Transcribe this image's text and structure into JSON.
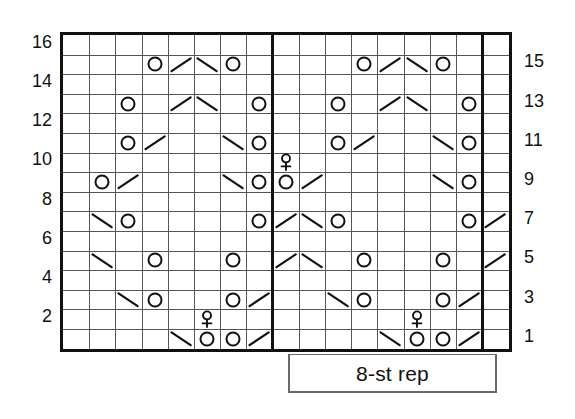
{
  "chart_data": {
    "type": "table",
    "grid": {
      "columns": 17,
      "rows": 16
    },
    "left_row_labels": [
      "16",
      "14",
      "12",
      "10",
      "8",
      "6",
      "4",
      "2"
    ],
    "right_row_labels": [
      "15",
      "13",
      "11",
      "9",
      "7",
      "5",
      "3",
      "1"
    ],
    "legend": {
      "repeat_label": "8-st rep",
      "repeat_width_stitches": 8
    },
    "repeat_boundaries": {
      "start_column": 9,
      "end_column": 17
    },
    "symbol_names": {
      "o": "yarn-over-circle",
      "slash": "k2tog-right-slant",
      "bslash": "ssk-left-slant",
      "bobble": "bobble-symbol"
    },
    "rows": [
      {
        "row": 16,
        "cells": []
      },
      {
        "row": 15,
        "cells": [
          {
            "col": 4,
            "sym": "o"
          },
          {
            "col": 5,
            "sym": "slash"
          },
          {
            "col": 6,
            "sym": "bslash"
          },
          {
            "col": 7,
            "sym": "o"
          },
          {
            "col": 12,
            "sym": "o"
          },
          {
            "col": 13,
            "sym": "slash"
          },
          {
            "col": 14,
            "sym": "bslash"
          },
          {
            "col": 15,
            "sym": "o"
          }
        ]
      },
      {
        "row": 14,
        "cells": []
      },
      {
        "row": 13,
        "cells": [
          {
            "col": 3,
            "sym": "o"
          },
          {
            "col": 5,
            "sym": "slash"
          },
          {
            "col": 6,
            "sym": "bslash"
          },
          {
            "col": 8,
            "sym": "o"
          },
          {
            "col": 11,
            "sym": "o"
          },
          {
            "col": 13,
            "sym": "slash"
          },
          {
            "col": 14,
            "sym": "bslash"
          },
          {
            "col": 16,
            "sym": "o"
          }
        ]
      },
      {
        "row": 12,
        "cells": []
      },
      {
        "row": 11,
        "cells": [
          {
            "col": 3,
            "sym": "o"
          },
          {
            "col": 4,
            "sym": "slash"
          },
          {
            "col": 7,
            "sym": "bslash"
          },
          {
            "col": 8,
            "sym": "o"
          },
          {
            "col": 11,
            "sym": "o"
          },
          {
            "col": 12,
            "sym": "slash"
          },
          {
            "col": 15,
            "sym": "bslash"
          },
          {
            "col": 16,
            "sym": "o"
          }
        ]
      },
      {
        "row": 10,
        "cells": [
          {
            "col": 9,
            "sym": "bobble"
          }
        ]
      },
      {
        "row": 9,
        "cells": [
          {
            "col": 2,
            "sym": "o"
          },
          {
            "col": 3,
            "sym": "slash"
          },
          {
            "col": 7,
            "sym": "bslash"
          },
          {
            "col": 8,
            "sym": "o"
          },
          {
            "col": 9,
            "sym": "o"
          },
          {
            "col": 10,
            "sym": "slash"
          },
          {
            "col": 15,
            "sym": "bslash"
          },
          {
            "col": 16,
            "sym": "o"
          }
        ]
      },
      {
        "row": 8,
        "cells": []
      },
      {
        "row": 7,
        "cells": [
          {
            "col": 2,
            "sym": "bslash"
          },
          {
            "col": 3,
            "sym": "o"
          },
          {
            "col": 8,
            "sym": "o"
          },
          {
            "col": 9,
            "sym": "slash"
          },
          {
            "col": 10,
            "sym": "bslash"
          },
          {
            "col": 11,
            "sym": "o"
          },
          {
            "col": 16,
            "sym": "o"
          },
          {
            "col": 17,
            "sym": "slash"
          }
        ]
      },
      {
        "row": 6,
        "cells": []
      },
      {
        "row": 5,
        "cells": [
          {
            "col": 2,
            "sym": "bslash"
          },
          {
            "col": 4,
            "sym": "o"
          },
          {
            "col": 7,
            "sym": "o"
          },
          {
            "col": 9,
            "sym": "slash"
          },
          {
            "col": 10,
            "sym": "bslash"
          },
          {
            "col": 12,
            "sym": "o"
          },
          {
            "col": 15,
            "sym": "o"
          },
          {
            "col": 17,
            "sym": "slash"
          }
        ]
      },
      {
        "row": 4,
        "cells": []
      },
      {
        "row": 3,
        "cells": [
          {
            "col": 3,
            "sym": "bslash"
          },
          {
            "col": 4,
            "sym": "o"
          },
          {
            "col": 7,
            "sym": "o"
          },
          {
            "col": 8,
            "sym": "slash"
          },
          {
            "col": 11,
            "sym": "bslash"
          },
          {
            "col": 12,
            "sym": "o"
          },
          {
            "col": 15,
            "sym": "o"
          },
          {
            "col": 16,
            "sym": "slash"
          }
        ]
      },
      {
        "row": 2,
        "cells": [
          {
            "col": 6,
            "sym": "bobble"
          },
          {
            "col": 14,
            "sym": "bobble"
          }
        ]
      },
      {
        "row": 1,
        "cells": [
          {
            "col": 5,
            "sym": "bslash"
          },
          {
            "col": 6,
            "sym": "o"
          },
          {
            "col": 7,
            "sym": "o"
          },
          {
            "col": 8,
            "sym": "slash"
          },
          {
            "col": 13,
            "sym": "bslash"
          },
          {
            "col": 14,
            "sym": "o"
          },
          {
            "col": 15,
            "sym": "o"
          },
          {
            "col": 16,
            "sym": "slash"
          }
        ]
      }
    ]
  }
}
